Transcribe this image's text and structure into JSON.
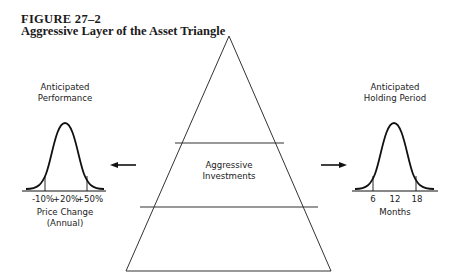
{
  "figure": {
    "number": "FIGURE 27–2",
    "title": "Aggressive Layer of the Asset Triangle"
  },
  "triangle": {
    "layers": [
      "",
      "Aggressive Investments",
      ""
    ],
    "middle_label_line1": "Aggressive",
    "middle_label_line2": "Investments"
  },
  "left_panel": {
    "title_line1": "Anticipated",
    "title_line2": "Performance",
    "ticks": [
      "-10%",
      "+20%",
      "+50%"
    ],
    "xlabel_line1": "Price Change",
    "xlabel_line2": "(Annual)",
    "arrow_direction": "left"
  },
  "right_panel": {
    "title_line1": "Anticipated",
    "title_line2": "Holding Period",
    "ticks": [
      "6",
      "12",
      "18"
    ],
    "xlabel": "Months",
    "arrow_direction": "right"
  },
  "colors": {
    "ink": "#1a1a1a",
    "background": "#ffffff"
  }
}
